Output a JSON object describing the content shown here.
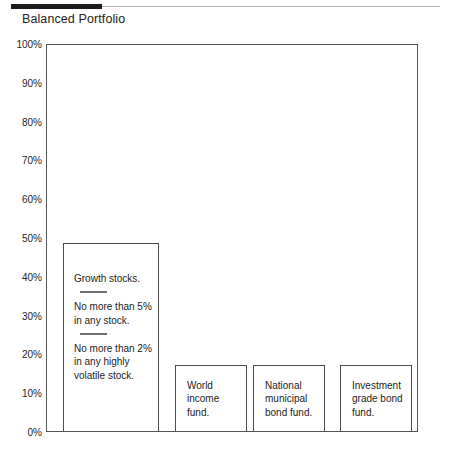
{
  "header": {
    "title": "Balanced Portfolio"
  },
  "chart_data": {
    "type": "bar",
    "title": "Balanced Portfolio",
    "xlabel": "",
    "ylabel": "",
    "ylim": [
      0,
      100
    ],
    "grid": false,
    "legend": "none",
    "y_tick_labels": [
      "100%",
      "90%",
      "80%",
      "70%",
      "60%",
      "50%",
      "40%",
      "30%",
      "20%",
      "10%",
      "0%"
    ],
    "y_tick_values": [
      100,
      90,
      80,
      70,
      60,
      50,
      40,
      30,
      20,
      10,
      0
    ],
    "categories": [
      "Growth stocks.",
      "World income fund.",
      "National municipal bond fund.",
      "Investment grade bond fund."
    ],
    "values": [
      48.5,
      17,
      17,
      17
    ],
    "bars": [
      {
        "value": 48.5,
        "blocks": [
          "Growth stocks.",
          "No more than 5% in any stock.",
          "No more than 2% in any highly volatile stock."
        ]
      },
      {
        "value": 17,
        "blocks": [
          "World income fund."
        ]
      },
      {
        "value": 17,
        "blocks": [
          "National municipal bond fund."
        ]
      },
      {
        "value": 17,
        "blocks": [
          "Investment grade bond fund."
        ]
      }
    ]
  }
}
